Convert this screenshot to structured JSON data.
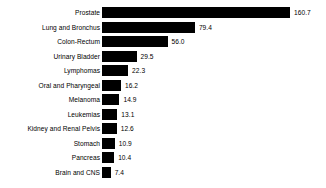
{
  "chart_data": {
    "type": "bar",
    "orientation": "horizontal",
    "title": "",
    "subtitle": "",
    "xlabel": "",
    "ylabel": "",
    "grid": false,
    "legend": null,
    "xlim": [
      0,
      160.7
    ],
    "px_per_unit": 1.17,
    "categories": [
      "Prostate",
      "Lung and Bronchus",
      "Colon-Rectum",
      "Urinary Bladder",
      "Lymphomas",
      "Oral and Pharyngeal",
      "Melanoma",
      "Leukemias",
      "Kidney and Renal Pelvis",
      "Stomach",
      "Pancreas",
      "Brain and CNS"
    ],
    "values": [
      160.7,
      79.4,
      56.0,
      29.5,
      22.3,
      16.2,
      14.9,
      13.1,
      12.6,
      10.9,
      10.4,
      7.4
    ],
    "value_labels": [
      "160.7",
      "79.4",
      "56.0",
      "29.5",
      "22.3",
      "16.2",
      "14.9",
      "13.1",
      "12.6",
      "10.9",
      "10.4",
      "7.4"
    ],
    "bar_color": "#000000",
    "background_color": "#ffffff",
    "text_color": "#000000"
  }
}
